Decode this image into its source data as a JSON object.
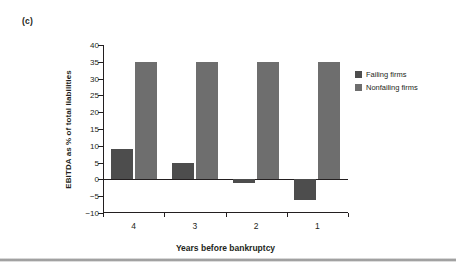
{
  "panel": {
    "label": "(c)"
  },
  "legend": {
    "position": "top-right",
    "entries": [
      {
        "label": "Failing firms",
        "color": "#4d4d4d"
      },
      {
        "label": "Nonfailing firms",
        "color": "#6e6e6e"
      }
    ]
  },
  "chart_data": {
    "type": "bar",
    "title": "",
    "xlabel": "Years before bankruptcy",
    "ylabel": "EBITDA as % of total liabilities",
    "categories": [
      "4",
      "3",
      "2",
      "1"
    ],
    "series": [
      {
        "name": "Failing firms",
        "color": "#4d4d4d",
        "values": [
          9,
          5,
          -1,
          -6
        ]
      },
      {
        "name": "Nonfailing firms",
        "color": "#6e6e6e",
        "values": [
          35,
          35,
          35,
          35
        ]
      }
    ],
    "ylim": [
      -10,
      40
    ],
    "ytick_step": 5,
    "yticks": [
      40,
      35,
      30,
      25,
      20,
      15,
      10,
      5,
      0,
      -5,
      -10
    ],
    "ytick_labels": [
      "40",
      "35",
      "30",
      "25",
      "20",
      "15",
      "10",
      "5",
      "0",
      "−5",
      "−10"
    ],
    "grid": false,
    "zero_line": true
  }
}
